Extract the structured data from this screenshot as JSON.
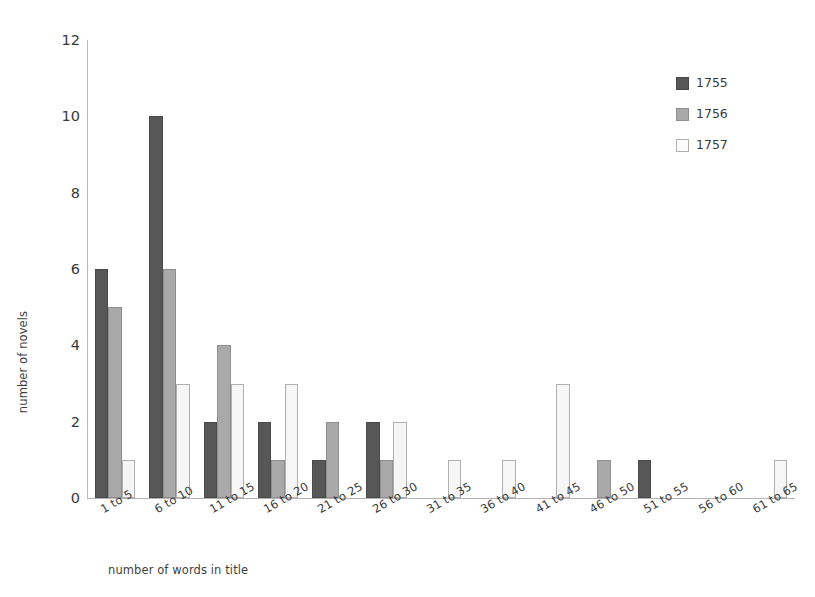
{
  "chart_data": {
    "type": "bar",
    "title": "",
    "subtitle": "",
    "xlabel": "number of words in title",
    "ylabel": "number of novels",
    "categories": [
      "1 to 5",
      "6 to 10",
      "11 to 15",
      "16 to 20",
      "21 to 25",
      "26 to 30",
      "31 to 35",
      "36 to 40",
      "41 to 45",
      "46 to 50",
      "51 to 55",
      "56 to 60",
      "61 to 65"
    ],
    "series": [
      {
        "name": "1755",
        "color": "#575757",
        "values": [
          6,
          10,
          2,
          2,
          1,
          2,
          0,
          0,
          0,
          0,
          1,
          0,
          0
        ]
      },
      {
        "name": "1756",
        "color": "#a9a9a9",
        "values": [
          5,
          6,
          4,
          1,
          2,
          1,
          0,
          0,
          0,
          1,
          0,
          0,
          0
        ]
      },
      {
        "name": "1757",
        "color": "#f6f6f6",
        "values": [
          1,
          3,
          3,
          3,
          0,
          2,
          1,
          1,
          3,
          0,
          0,
          0,
          1
        ]
      }
    ],
    "ylim": [
      0,
      12
    ],
    "yticks": [
      0,
      2,
      4,
      6,
      8,
      10,
      12
    ],
    "ytick_labels": [
      "0",
      "2",
      "4",
      "6",
      "8",
      "10",
      "12"
    ],
    "grid": false,
    "legend_position": "top-right",
    "legend_entries": [
      "1755",
      "1756",
      "1757"
    ]
  }
}
